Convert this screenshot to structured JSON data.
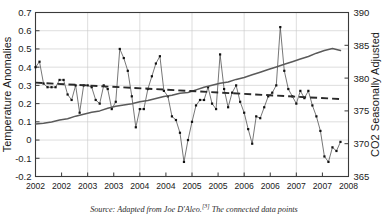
{
  "caption": {
    "prefix": "Source: Adapted from Joe D'Aleo.",
    "ref": "[3]",
    "suffix": " The connected data points"
  },
  "chart_data": {
    "type": "line",
    "title": "",
    "xlabel": "",
    "ylabel": "Temperature Anomalies",
    "y2label": "CO2 Seasonally Adjusted",
    "ylim": [
      -0.2,
      0.7
    ],
    "y2lim": [
      365,
      390
    ],
    "yticks": [
      "0.7",
      "0.6",
      "0.5",
      "0.4",
      "0.3",
      "0.2",
      "0.1",
      "0",
      "-0.1",
      "-0.2"
    ],
    "ytick_values": [
      0.7,
      0.6,
      0.5,
      0.4,
      0.3,
      0.2,
      0.1,
      0,
      -0.1,
      -0.2
    ],
    "y2ticks": [
      "390",
      "385",
      "380",
      "375",
      "370",
      "365"
    ],
    "y2tick_values": [
      390,
      385,
      380,
      375,
      370,
      365
    ],
    "xtick_labels": [
      "2002",
      "2002",
      "2003",
      "2003",
      "2004",
      "2004",
      "2005",
      "2005",
      "2006",
      "2006",
      "2007",
      "2007",
      "2008"
    ],
    "xlim": [
      0,
      78
    ],
    "grid": true,
    "legend_position": "none",
    "series": [
      {
        "name": "Temperature Anomalies",
        "axis": "left",
        "style": "line-markers",
        "color": "#4a4a4a",
        "x": [
          0,
          1,
          2,
          3,
          4,
          5,
          6,
          7,
          8,
          9,
          10,
          11,
          12,
          13,
          14,
          15,
          16,
          17,
          18,
          19,
          20,
          21,
          22,
          23,
          24,
          25,
          26,
          27,
          28,
          29,
          30,
          31,
          32,
          33,
          34,
          35,
          36,
          37,
          38,
          39,
          40,
          41,
          42,
          43,
          44,
          45,
          46,
          47,
          48,
          49,
          50,
          51,
          52,
          53,
          54,
          55,
          56,
          57,
          58,
          59,
          60,
          61,
          62,
          63,
          64,
          65,
          66,
          67,
          68,
          69,
          70,
          71,
          72,
          73,
          74,
          75,
          76
        ],
        "values": [
          0.4,
          0.43,
          0.31,
          0.29,
          0.29,
          0.29,
          0.33,
          0.33,
          0.25,
          0.22,
          0.3,
          0.15,
          0.3,
          0.3,
          0.29,
          0.22,
          0.2,
          0.3,
          0.28,
          0.17,
          0.21,
          0.5,
          0.45,
          0.38,
          0.24,
          0.07,
          0.17,
          0.17,
          0.28,
          0.35,
          0.42,
          0.46,
          0.27,
          0.24,
          0.13,
          0.11,
          0.04,
          -0.12,
          0.0,
          0.1,
          0.19,
          0.22,
          0.22,
          0.29,
          0.2,
          0.17,
          0.47,
          0.28,
          0.18,
          0.26,
          0.3,
          0.21,
          0.15,
          0.06,
          -0.02,
          0.13,
          0.12,
          0.18,
          0.24,
          0.26,
          0.3,
          0.62,
          0.38,
          0.28,
          0.24,
          0.2,
          0.27,
          0.23,
          0.27,
          0.19,
          0.13,
          0.05,
          -0.09,
          -0.12,
          -0.04,
          -0.06,
          -0.01
        ]
      },
      {
        "name": "CO2 Seasonally Adjusted",
        "axis": "right",
        "style": "line",
        "color": "#5a5a5a",
        "x": [
          0,
          2,
          4,
          6,
          8,
          10,
          12,
          14,
          16,
          18,
          20,
          22,
          24,
          26,
          28,
          30,
          32,
          34,
          36,
          38,
          40,
          42,
          44,
          46,
          48,
          50,
          52,
          54,
          56,
          58,
          60,
          62,
          64,
          66,
          68,
          70,
          72,
          74,
          76
        ],
        "values": [
          373.0,
          373.1,
          373.3,
          373.6,
          373.8,
          374.2,
          374.5,
          374.8,
          375.0,
          375.4,
          375.7,
          375.9,
          376.1,
          376.4,
          376.6,
          376.9,
          377.2,
          377.4,
          377.7,
          377.8,
          378.2,
          378.6,
          378.9,
          379.2,
          379.4,
          379.8,
          380.1,
          380.5,
          380.9,
          381.3,
          381.7,
          382.1,
          382.5,
          382.9,
          383.3,
          383.8,
          384.2,
          384.5,
          384.2
        ]
      },
      {
        "name": "Temperature Trend",
        "axis": "left",
        "style": "dashed-line",
        "color": "#2a2a2a",
        "x": [
          0,
          76
        ],
        "values": [
          0.315,
          0.225
        ]
      }
    ]
  }
}
